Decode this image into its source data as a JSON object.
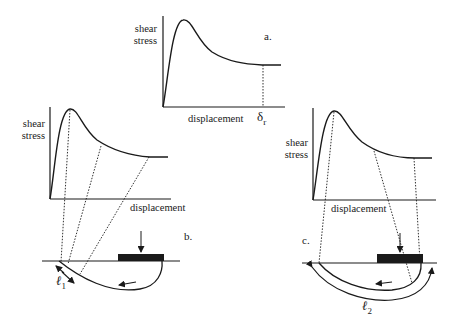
{
  "figure": {
    "panels": [
      {
        "id": "a",
        "tag": "a.",
        "ylabel_line1": "shear",
        "ylabel_line2": "stress",
        "xlabel": "displacement",
        "marker": "δ",
        "marker_sub": "r"
      },
      {
        "id": "b",
        "tag": "b.",
        "ylabel_line1": "shear",
        "ylabel_line2": "stress",
        "xlabel": "displacement",
        "length_symbol": "ℓ",
        "length_sub": "1"
      },
      {
        "id": "c",
        "tag": "c.",
        "ylabel_line1": "shear",
        "ylabel_line2": "stress",
        "xlabel": "displacement",
        "length_symbol": "ℓ",
        "length_sub": "2"
      }
    ],
    "colors": {
      "ink": "#1a1a1a",
      "background": "#ffffff"
    }
  }
}
